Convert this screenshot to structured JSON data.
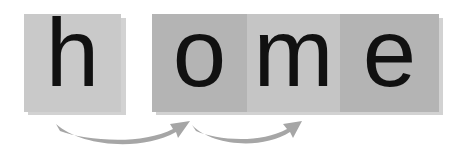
{
  "diagram": {
    "word": "home",
    "tiles": [
      {
        "letter": "h",
        "group": "separate",
        "shade": "#c9c9c9"
      },
      {
        "letter": "o",
        "group": "joined",
        "shade": "#b4b4b4"
      },
      {
        "letter": "m",
        "group": "joined",
        "shade": "#c5c5c5"
      },
      {
        "letter": "e",
        "group": "joined",
        "shade": "#b4b4b4"
      }
    ],
    "arrows": [
      {
        "from": "h",
        "to": "o",
        "color": "#a6a6a6"
      },
      {
        "from": "o",
        "to": "m",
        "color": "#a6a6a6"
      }
    ],
    "colors": {
      "letter": "#111111",
      "arrow": "#a6a6a6",
      "background": "#ffffff"
    }
  }
}
